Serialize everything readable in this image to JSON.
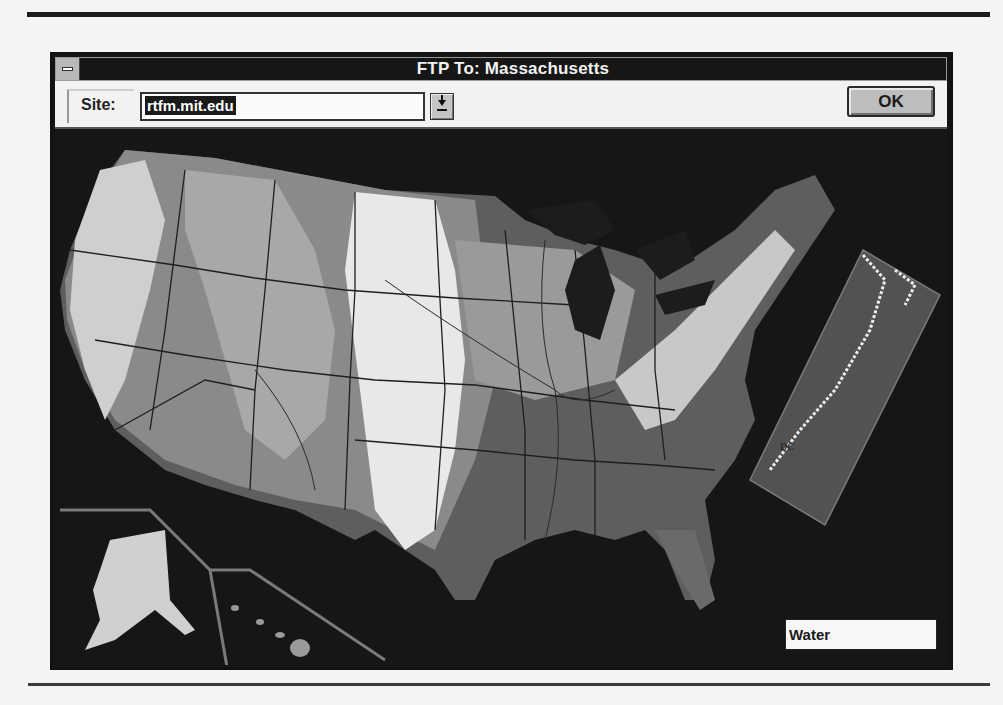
{
  "window": {
    "title": "FTP To: Massachusetts",
    "system_menu_icon": "system-menu-icon"
  },
  "toolbar": {
    "site_label": "Site:",
    "site_value": "rtfm.mit.edu",
    "dropdown_icon": "dropdown-arrow-icon",
    "ok_label": "OK"
  },
  "map": {
    "description": "Shaded relief map of the United States with state borders and rivers; Alaska and Hawaii insets at lower left; Mid-Atlantic/New England detail inset at right",
    "inset_label": "DC",
    "legend_label": "Water",
    "colors": {
      "water": "#161616",
      "lowland": "#5e5e5e",
      "midland": "#8a8a8a",
      "upland": "#b5b5b5",
      "highland": "#e8e8e8",
      "border_line": "#1e1e1e",
      "inset_frame": "#7a7a7a"
    }
  }
}
